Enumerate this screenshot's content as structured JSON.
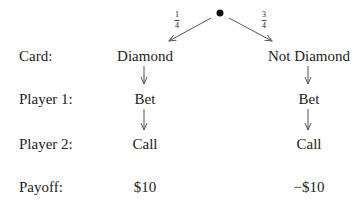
{
  "root": {
    "probabilities": [
      {
        "num": "1",
        "den": "4"
      },
      {
        "num": "3",
        "den": "4"
      }
    ]
  },
  "rows": [
    {
      "label": "Card:",
      "left": "Diamond",
      "right": "Not Diamond"
    },
    {
      "label": "Player 1:",
      "left": "Bet",
      "right": "Bet"
    },
    {
      "label": "Player 2:",
      "left": "Call",
      "right": "Call"
    },
    {
      "label": "Payoff:",
      "left": "$10",
      "right": "−$10"
    }
  ],
  "colors": {
    "line": "#555555",
    "text": "#222222"
  }
}
